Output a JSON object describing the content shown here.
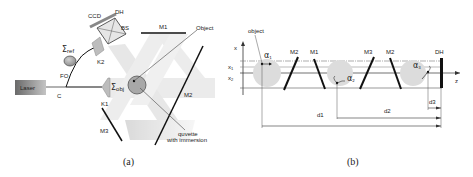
{
  "panel_a": {
    "caption": "(a)",
    "laser_label": "Laser",
    "coupler_label": "C",
    "fiber_label": "FO",
    "sigma_ref_label": "Σ",
    "sigma_ref_sub": "ref",
    "sigma_obj_label": "Σ",
    "sigma_obj_sub": "obj",
    "k1_label": "K1",
    "k2_label": "K2",
    "ccd_label": "CCD",
    "dh_label": "DH",
    "bs_label": "BS",
    "m1_label": "M1",
    "m2_label": "M2",
    "m3_label": "M3",
    "object_label": "Object",
    "quvette_label_1": "quvette",
    "quvette_label_2": "with immersion"
  },
  "panel_b": {
    "caption": "(b)",
    "object_label": "object",
    "x_axis_label": "x",
    "z_axis_label": "z",
    "x1_label": "x",
    "x1_sub": "1",
    "x2_label": "x",
    "x2_sub": "2",
    "alpha1_label": "α",
    "alpha1_sub": "1",
    "alpha2_label": "α",
    "alpha2_sub": "2",
    "alpha3_label": "α",
    "alpha3_sub": "3",
    "mirrors": [
      "M2",
      "M1",
      "M3",
      "M2"
    ],
    "dh_label": "DH",
    "d1_label": "d1",
    "d2_label": "d2",
    "d3_label": "d3"
  },
  "colors": {
    "line": "#111111",
    "beam": "#d9d9d9",
    "circle": "#c8c8c8",
    "laser_dark": "#6e6e6e",
    "laser_light": "#bdbdbd"
  }
}
